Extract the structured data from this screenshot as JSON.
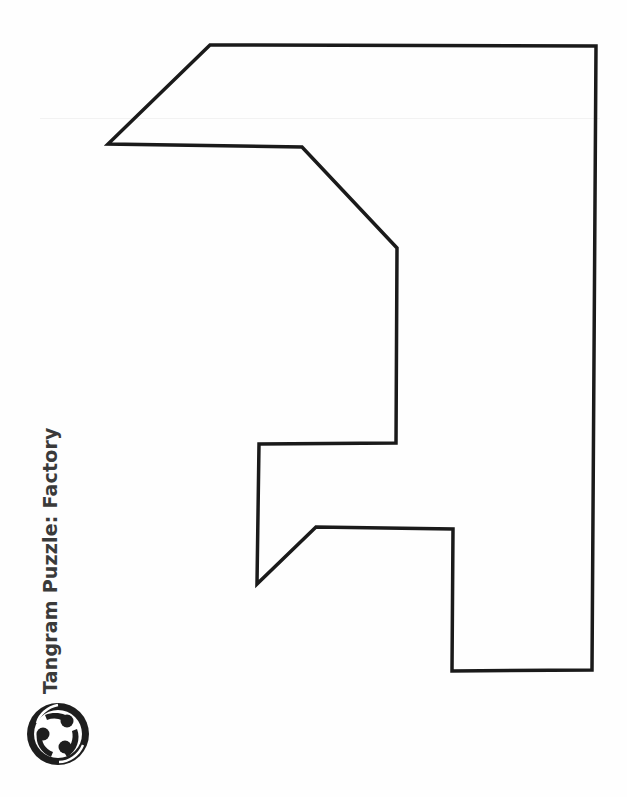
{
  "document": {
    "title": "Tangram Puzzle: Factory",
    "logo_icon": "community-circle-logo-icon"
  },
  "puzzle": {
    "name": "Factory",
    "outline_color": "#1a1a1a",
    "outline_width": 3.5,
    "points": "210,45 596,46 592,670 452,671 453,529 316,527 257,584 259,444 396,443 397,248 302,147 108,144"
  },
  "colors": {
    "background": "#fefefe",
    "title_text": "#3a3a3a",
    "logo": "#1e1e1e"
  }
}
